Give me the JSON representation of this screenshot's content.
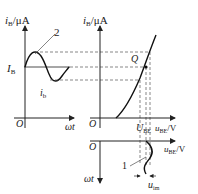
{
  "diagram": {
    "left_plot": {
      "y_axis_label": "iB/μA",
      "y_axis_label_main": "i",
      "y_axis_label_sub": "B",
      "y_axis_label_unit": "/μA",
      "x_axis_label": "ωt",
      "origin_label": "O",
      "ib_level_label_main": "I",
      "ib_level_label_sub": "B",
      "wave_label_main": "i",
      "wave_label_sub": "b",
      "curve_number": "2"
    },
    "right_plot": {
      "y_axis_label_main": "i",
      "y_axis_label_sub": "B",
      "y_axis_label_unit": "/μA",
      "x_axis_label_main": "u",
      "x_axis_label_sub": "BE",
      "x_axis_label_unit": "/V",
      "origin_label": "O",
      "q_point_label": "Q",
      "ube_level_label_main": "U",
      "ube_level_label_sub": "BE"
    },
    "bottom_plot": {
      "origin_label": "O",
      "x_axis_label_main": "u",
      "x_axis_label_sub": "BE",
      "x_axis_label_unit": "/V",
      "y_axis_label": "ωt",
      "curve_number": "1",
      "amplitude_label_main": "u",
      "amplitude_label_sub": "im"
    }
  }
}
